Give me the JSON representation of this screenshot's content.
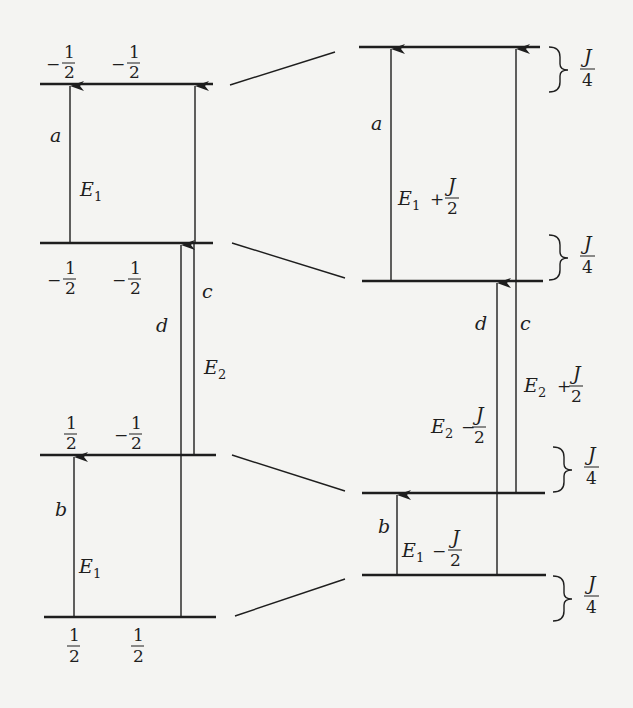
{
  "diagram": {
    "type": "energy-level-diagram",
    "left": {
      "levels": [
        {
          "spins": [
            "−",
            "−"
          ],
          "num": [
            "1",
            "1"
          ],
          "den": [
            "2",
            "2"
          ]
        },
        {
          "spins": [
            "−",
            "−"
          ],
          "num": [
            "1",
            "1"
          ],
          "den": [
            "2",
            "2"
          ]
        },
        {
          "spins": [
            "",
            "−"
          ],
          "num": [
            "1",
            "1"
          ],
          "den": [
            "2",
            "2"
          ]
        },
        {
          "spins": [
            "",
            ""
          ],
          "num": [
            "1",
            "1"
          ],
          "den": [
            "2",
            "2"
          ]
        }
      ],
      "transitions": {
        "a": {
          "label": "a",
          "energy_var": "E",
          "energy_sub": "1"
        },
        "b": {
          "label": "b",
          "energy_var": "E",
          "energy_sub": "1"
        },
        "c": {
          "label": "c",
          "energy_var": "E",
          "energy_sub": "2"
        },
        "d": {
          "label": "d"
        }
      }
    },
    "right": {
      "shift_labels": {
        "num": "J",
        "den": "4"
      },
      "transitions": {
        "a": {
          "label": "a",
          "energy_var": "E",
          "energy_sub": "1",
          "op": "+",
          "num": "J",
          "den": "2"
        },
        "b": {
          "label": "b",
          "energy_var": "E",
          "energy_sub": "1",
          "op": "−",
          "num": "J",
          "den": "2"
        },
        "c": {
          "label": "c",
          "energy_var": "E",
          "energy_sub": "2",
          "op": "+",
          "num": "J",
          "den": "2"
        },
        "d": {
          "label": "d",
          "energy_var": "E",
          "energy_sub": "2",
          "op": "−",
          "num": "J",
          "den": "2"
        }
      }
    }
  }
}
